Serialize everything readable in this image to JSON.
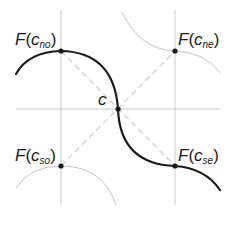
{
  "diagram": {
    "colors": {
      "background": "#ffffff",
      "grid": "#c8c8c8",
      "dashed": "#cfcfcf",
      "curve": "#1a1a1a",
      "faint_arc": "#c4c4c4",
      "point": "#1a1a1a",
      "text": "#1a1a1a"
    },
    "labels": {
      "center": "c",
      "no": {
        "func": "F",
        "open": "(",
        "var": "c",
        "sub": "no",
        "close": ")"
      },
      "ne": {
        "func": "F",
        "open": "(",
        "var": "c",
        "sub": "ne",
        "close": ")"
      },
      "so": {
        "func": "F",
        "open": "(",
        "var": "c",
        "sub": "so",
        "close": ")"
      },
      "se": {
        "func": "F",
        "open": "(",
        "var": "c",
        "sub": "se",
        "close": ")"
      }
    },
    "points": [
      {
        "id": "no",
        "x": 61,
        "y": 51
      },
      {
        "id": "ne",
        "x": 175,
        "y": 51
      },
      {
        "id": "c",
        "x": 118,
        "y": 109
      },
      {
        "id": "so",
        "x": 61,
        "y": 166
      },
      {
        "id": "se",
        "x": 175,
        "y": 166
      }
    ]
  }
}
